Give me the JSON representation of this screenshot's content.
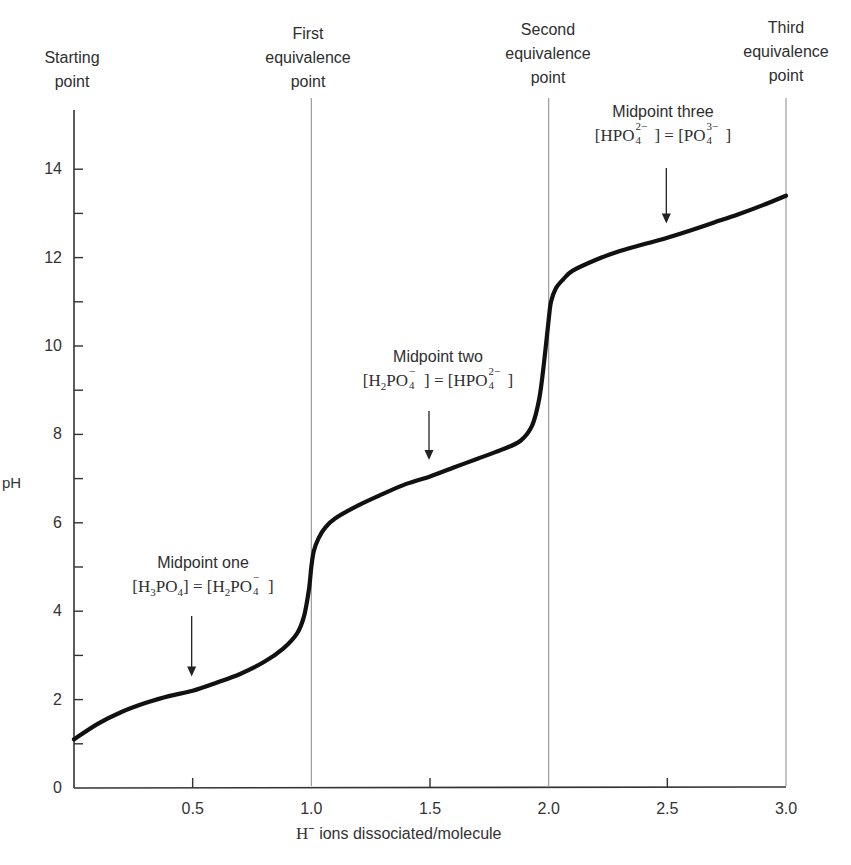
{
  "chart_data": {
    "type": "line",
    "title": "",
    "xlabel": "H⁻ ions dissociated/molecule",
    "xlabel_prefix": "H",
    "xlabel_sup": "−",
    "xlabel_rest": " ions dissociated/molecule",
    "ylabel": "pH",
    "xlim": [
      0,
      3.0
    ],
    "ylim": [
      0,
      15
    ],
    "grid": false,
    "x_ticks": [
      "0.5",
      "1.0",
      "1.5",
      "2.0",
      "2.5",
      "3.0"
    ],
    "x_tick_values": [
      0.5,
      1.0,
      1.5,
      2.0,
      2.5,
      3.0
    ],
    "y_ticks": [
      "0",
      "2",
      "4",
      "6",
      "8",
      "10",
      "12",
      "14"
    ],
    "y_tick_values": [
      0,
      2,
      4,
      6,
      8,
      10,
      12,
      14
    ],
    "y_minor_ticks": [
      1,
      3,
      5,
      7,
      9,
      11,
      13
    ],
    "series": [
      {
        "name": "Phosphoric acid titration curve",
        "x": [
          0.0,
          0.1,
          0.2,
          0.3,
          0.4,
          0.5,
          0.6,
          0.7,
          0.8,
          0.88,
          0.94,
          0.97,
          0.99,
          1.0,
          1.01,
          1.03,
          1.06,
          1.1,
          1.2,
          1.3,
          1.4,
          1.5,
          1.6,
          1.7,
          1.8,
          1.88,
          1.93,
          1.96,
          1.98,
          2.0,
          2.01,
          2.03,
          2.06,
          2.1,
          2.2,
          2.3,
          2.4,
          2.5,
          2.6,
          2.7,
          2.8,
          2.9,
          3.0
        ],
        "y": [
          1.1,
          1.45,
          1.72,
          1.92,
          2.08,
          2.2,
          2.38,
          2.58,
          2.85,
          3.15,
          3.5,
          3.9,
          4.5,
          5.0,
          5.35,
          5.65,
          5.9,
          6.1,
          6.4,
          6.65,
          6.88,
          7.05,
          7.25,
          7.45,
          7.65,
          7.85,
          8.2,
          8.8,
          9.6,
          10.6,
          11.0,
          11.3,
          11.5,
          11.7,
          11.95,
          12.15,
          12.3,
          12.45,
          12.62,
          12.8,
          12.98,
          13.18,
          13.4
        ]
      }
    ],
    "equivalence_lines": [
      {
        "x": 0.0,
        "label_lines": [
          "Starting",
          "point"
        ]
      },
      {
        "x": 1.0,
        "label_lines": [
          "First",
          "equivalence",
          "point"
        ]
      },
      {
        "x": 2.0,
        "label_lines": [
          "Second",
          "equivalence",
          "point"
        ]
      },
      {
        "x": 3.0,
        "label_lines": [
          "Third",
          "equivalence",
          "point"
        ]
      }
    ],
    "annotations": [
      {
        "name": "Midpoint one",
        "x": 0.5,
        "arrow_to_y": 2.25,
        "equation": "[H3PO4] = [H2PO4−]"
      },
      {
        "name": "Midpoint two",
        "x": 1.5,
        "arrow_to_y": 7.15,
        "equation": "[H2PO4−] = [HPO4 2−]"
      },
      {
        "name": "Midpoint three",
        "x": 2.5,
        "arrow_to_y": 12.5,
        "equation": "[HPO4 2−] = [PO4 3−]"
      }
    ]
  },
  "labels": {
    "starting": [
      "Starting",
      "point"
    ],
    "first": [
      "First",
      "equivalence",
      "point"
    ],
    "second": [
      "Second",
      "equivalence",
      "point"
    ],
    "third": [
      "Third",
      "equivalence",
      "point"
    ],
    "mid1_title": "Midpoint one",
    "mid2_title": "Midpoint two",
    "mid3_title": "Midpoint three",
    "ph": "pH"
  },
  "formulas": {
    "H": "H",
    "P": "P",
    "O": "O",
    "PO": "PO",
    "n2": "2",
    "n3": "3",
    "n4": "4",
    "minus": "−",
    "two_minus": "2−",
    "three_minus": "3−",
    "lb": "[",
    "rb": "]",
    "eq": " = ",
    "HPO": "HPO"
  }
}
